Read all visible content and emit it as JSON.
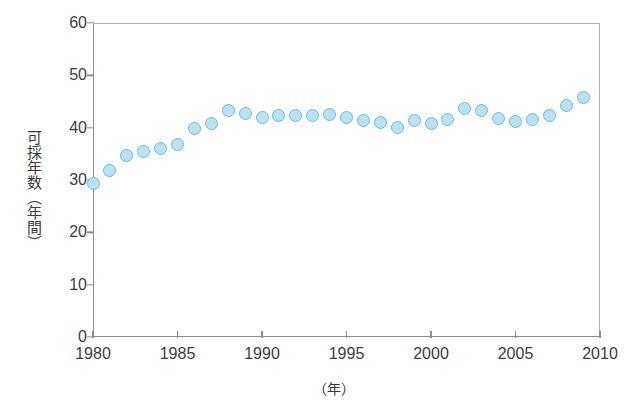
{
  "chart_data": {
    "type": "scatter",
    "title": "",
    "subtitle": "",
    "xlabel": "（年）",
    "ylabel": "可採年数（年間）",
    "xlim": [
      1980,
      2010
    ],
    "ylim": [
      0,
      60
    ],
    "xticks": [
      1980,
      1985,
      1990,
      1995,
      2000,
      2005,
      2010
    ],
    "yticks": [
      0,
      10,
      20,
      30,
      40,
      50,
      60
    ],
    "grid": false,
    "legend": null,
    "marker": {
      "shape": "circle",
      "fill_color": "#b9e3f5",
      "edge_color": "#6fb9d8",
      "size_px": 13
    },
    "series": [
      {
        "name": "可採年数",
        "x": [
          1980,
          1981,
          1982,
          1983,
          1984,
          1985,
          1986,
          1987,
          1988,
          1989,
          1990,
          1991,
          1992,
          1993,
          1994,
          1995,
          1996,
          1997,
          1998,
          1999,
          2000,
          2001,
          2002,
          2003,
          2004,
          2005,
          2006,
          2007,
          2008,
          2009
        ],
        "values": [
          29.3,
          31.8,
          34.6,
          35.5,
          36.0,
          36.8,
          39.8,
          40.8,
          43.2,
          42.7,
          42.0,
          42.4,
          42.3,
          42.4,
          42.5,
          42.0,
          41.4,
          41.0,
          40.1,
          41.3,
          40.8,
          41.6,
          43.6,
          43.3,
          41.7,
          41.2,
          41.6,
          42.4,
          44.3,
          45.8
        ]
      }
    ],
    "axis_colors": {
      "axis_line": "#8d8d8d",
      "frame_line": "#b4b4b4",
      "tick_text": "#3d3d3d"
    }
  }
}
